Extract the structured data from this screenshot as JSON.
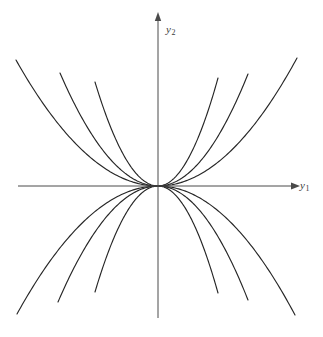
{
  "figure": {
    "kind": "phase-portrait",
    "background_color": "#ffffff",
    "curve_color": "#262626",
    "axis_color": "#4a4a4a",
    "label_color": "#3b3b3b"
  },
  "axes": {
    "horizontal": {
      "name": "y1",
      "label_text": "y",
      "label_subscript": "1",
      "x_start": 18,
      "x_end": 294,
      "y": 186,
      "arrow": "right"
    },
    "vertical": {
      "name": "y2",
      "label_text": "y",
      "label_subscript": "2",
      "y_start": 17,
      "y_end": 318,
      "x": 158,
      "arrow": "up"
    },
    "origin": {
      "x": 158,
      "y": 186
    }
  },
  "chart_data": {
    "type": "line",
    "title": "",
    "xlabel": "y1",
    "ylabel": "y2",
    "xlim": [
      -158,
      165
    ],
    "ylim": [
      -132,
      169
    ],
    "grid": false,
    "legend": null,
    "family_equation": "y2 = c * y1^2",
    "origin_px": {
      "x": 158,
      "y": 186
    },
    "curves_per_quadrant": 3,
    "total_curves": 12,
    "curvature_coefficients": [
      0.0062,
      0.0118,
      0.0225
    ],
    "series": [
      {
        "name": "upper-left-outer",
        "quadrant": "upper-left",
        "c": 0.0062,
        "endpoint_px": {
          "x": 16,
          "y": 60
        }
      },
      {
        "name": "upper-left-middle",
        "quadrant": "upper-left",
        "c": 0.0118,
        "endpoint_px": {
          "x": 60,
          "y": 73
        }
      },
      {
        "name": "upper-left-inner",
        "quadrant": "upper-left",
        "c": 0.0225,
        "endpoint_px": {
          "x": 95,
          "y": 82
        }
      },
      {
        "name": "upper-right-inner",
        "quadrant": "upper-right",
        "c": 0.0225,
        "endpoint_px": {
          "x": 218,
          "y": 78
        }
      },
      {
        "name": "upper-right-middle",
        "quadrant": "upper-right",
        "c": 0.0118,
        "endpoint_px": {
          "x": 248,
          "y": 74
        }
      },
      {
        "name": "upper-right-outer",
        "quadrant": "upper-right",
        "c": 0.0062,
        "endpoint_px": {
          "x": 297,
          "y": 58
        }
      },
      {
        "name": "lower-left-outer",
        "quadrant": "lower-left",
        "c": 0.0062,
        "endpoint_px": {
          "x": 17,
          "y": 314
        }
      },
      {
        "name": "lower-left-middle",
        "quadrant": "lower-left",
        "c": 0.0118,
        "endpoint_px": {
          "x": 58,
          "y": 302
        }
      },
      {
        "name": "lower-left-inner",
        "quadrant": "lower-left",
        "c": 0.0225,
        "endpoint_px": {
          "x": 95,
          "y": 292
        }
      },
      {
        "name": "lower-right-inner",
        "quadrant": "lower-right",
        "c": 0.0225,
        "endpoint_px": {
          "x": 218,
          "y": 293
        }
      },
      {
        "name": "lower-right-middle",
        "quadrant": "lower-right",
        "c": 0.0118,
        "endpoint_px": {
          "x": 248,
          "y": 300
        }
      },
      {
        "name": "lower-right-outer",
        "quadrant": "lower-right",
        "c": 0.0062,
        "endpoint_px": {
          "x": 295,
          "y": 315
        }
      }
    ]
  }
}
